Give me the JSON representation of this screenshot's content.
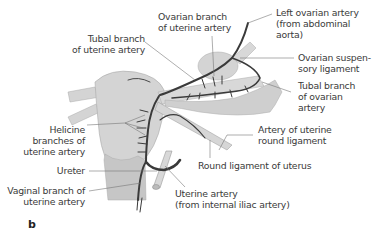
{
  "figure": {
    "panel_letter": "b",
    "labels": {
      "ovarian_branch": [
        "Ovarian branch",
        "of uterine artery"
      ],
      "left_ovarian_artery": [
        "Left ovarian artery",
        "(from abdominal",
        "aorta)"
      ],
      "tubal_branch_uterine": [
        "Tubal branch",
        "of uterine artery"
      ],
      "ovarian_suspensory": [
        "Ovarian suspen-",
        "sory ligament"
      ],
      "tubal_branch_ovarian": [
        "Tubal branch",
        "of ovarian",
        "artery"
      ],
      "helicine": [
        "Helicine",
        "branches of",
        "uterine artery"
      ],
      "artery_round_ligament": [
        "Artery of uterine",
        "round ligament"
      ],
      "round_ligament": [
        "Round ligament of uterus"
      ],
      "ureter": [
        "Ureter"
      ],
      "vaginal_branch": [
        "Vaginal branch of",
        "uterine artery"
      ],
      "uterine_artery": [
        "Uterine artery",
        "(from internal iliac artery)"
      ]
    },
    "colors": {
      "tissue": "#d4d4d4",
      "tissue_dark": "#bdbdbd",
      "artery": "#3a3a3a",
      "leader": "#777777",
      "text": "#3a3a3a"
    }
  }
}
